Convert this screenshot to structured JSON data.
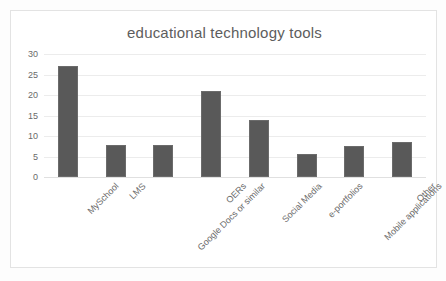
{
  "chart_data": {
    "type": "bar",
    "title": "educational technology tools",
    "xlabel": "",
    "ylabel": "",
    "categories": [
      "MySchool",
      "LMS",
      "Google Docs or similar",
      "OERs",
      "Social Media",
      "e-portfolios",
      "Mobile applications",
      "Other"
    ],
    "values": [
      27,
      7.7,
      7.7,
      21,
      14,
      5.6,
      7.5,
      8.6
    ],
    "ylim": [
      0,
      30
    ],
    "yticks": [
      0,
      5,
      10,
      15,
      20,
      25,
      30
    ],
    "ytick_labels": [
      "0",
      "5",
      "10",
      "15",
      "20",
      "25",
      "30"
    ],
    "grid": true,
    "legend": false,
    "bar_color": "#595959",
    "grid_color": "#ececec",
    "text_color": "#6a6a6a",
    "frame_color": "#e3e3e3",
    "background": "#ffffff"
  }
}
